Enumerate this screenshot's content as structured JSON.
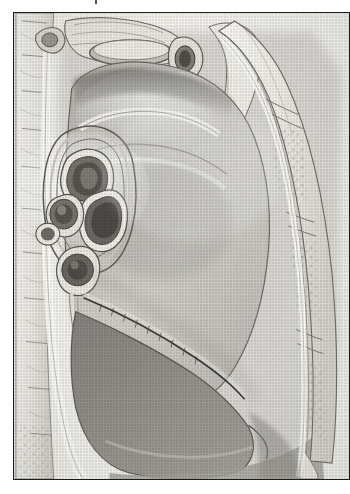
{
  "figure": {
    "kind": "anatomical-illustration",
    "style": "grayscale pen-and-ink stipple engraving, scanned halftone",
    "orientation": "anterior to the right, posterior to the left, superior at top",
    "frame": {
      "border_color": "#1b1b1b",
      "border_width_px": 1.6,
      "x": 13,
      "y": 12,
      "width": 337,
      "height": 468
    },
    "background_color": "#ffffff",
    "plate_color": "#f6f5f2",
    "has_caption_text": false,
    "cropped_text_artifact_top": true
  },
  "palette": {
    "ink_dark": "#2b2b2b",
    "ink_mid": "#6e6e6e",
    "ink_light": "#a9a9a9",
    "lung_light": "#cfcdc8",
    "lung_mid": "#b3b1ab",
    "lung_dark": "#8f8d88",
    "lung_base_shadow": "#7c7a76",
    "bone_white": "#f3f1ec",
    "bone_shade": "#d8d5cd",
    "vessel_lumen": "#5c5a56",
    "vessel_wall": "#efeee9",
    "cavity_shadow": "#9a9892"
  },
  "structures": [
    {
      "id": "vertebral-column",
      "label": "Vertebral column (thoracic vertebrae)",
      "region": "left margin",
      "tone": "bone_white"
    },
    {
      "id": "great-vessels-cut",
      "label": "Great vessels and trachea, cut in cross-section",
      "region": "superior mediastinum",
      "tone": "bone_shade"
    },
    {
      "id": "aortic-arch",
      "label": "Aortic arch groove",
      "region": "upper mediastinal surface",
      "tone": "lung_mid"
    },
    {
      "id": "hilum",
      "label": "Hilum of the lung (root)",
      "region": "mid-left",
      "tone": "ink_mid"
    },
    {
      "id": "main-bronchus",
      "label": "Main bronchus, cut surface",
      "region": "hilum, superior",
      "tone": "vessel_lumen"
    },
    {
      "id": "pulmonary-artery",
      "label": "Pulmonary artery, cut surface",
      "region": "hilum, anterior",
      "tone": "vessel_lumen"
    },
    {
      "id": "pulmonary-veins",
      "label": "Pulmonary veins, cut surfaces",
      "region": "hilum, inferior",
      "tone": "vessel_lumen"
    },
    {
      "id": "pulmonary-ligament",
      "label": "Pulmonary ligament",
      "region": "below hilum",
      "tone": "ink_light"
    },
    {
      "id": "oblique-fissure",
      "label": "Oblique fissure",
      "region": "diagonal across lung",
      "tone": "ink_dark"
    },
    {
      "id": "lung-upper-lobe",
      "label": "Upper lobe, mediastinal surface",
      "region": "upper two-thirds",
      "tone": "lung_light"
    },
    {
      "id": "lung-lower-lobe",
      "label": "Lower lobe / lung base",
      "region": "inferior",
      "tone": "lung_base_shadow"
    },
    {
      "id": "diaphragmatic-surface",
      "label": "Diaphragmatic surface",
      "region": "bottom",
      "tone": "lung_dark"
    },
    {
      "id": "sternum-costal-cartilage",
      "label": "Sternum and costal cartilages with cancellous bone",
      "region": "right margin",
      "tone": "bone_white"
    },
    {
      "id": "chest-wall",
      "label": "Anterior chest wall / pleural reflection",
      "region": "right border",
      "tone": "bone_shade"
    },
    {
      "id": "costophrenic-recess",
      "label": "Costodiaphragmatic recess",
      "region": "lower right",
      "tone": "cavity_shadow"
    }
  ]
}
